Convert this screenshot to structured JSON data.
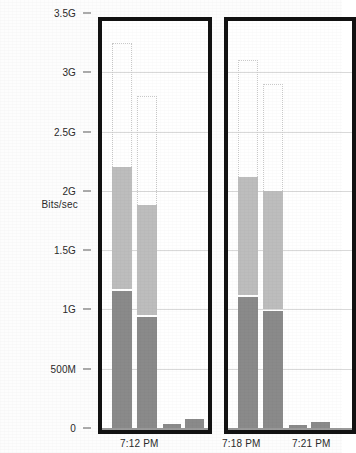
{
  "chart_data": {
    "type": "bar",
    "title": "",
    "subtitle": "",
    "xlabel": "",
    "ylabel": "Bits/sec",
    "stacked": true,
    "grid": true,
    "legend": null,
    "ylim": [
      0,
      3.5
    ],
    "y_unit": "bits/sec",
    "y_ticks": [
      {
        "label": "3.5G",
        "value": 3.5
      },
      {
        "label": "3G",
        "value": 3.0
      },
      {
        "label": "2.5G",
        "value": 2.5
      },
      {
        "label": "2G",
        "value": 2.0
      },
      {
        "label": "1.5G",
        "value": 1.5
      },
      {
        "label": "1G",
        "value": 1.0
      },
      {
        "label": "500M",
        "value": 0.5
      },
      {
        "label": "0",
        "value": 0.0
      }
    ],
    "x_tick_labels": [
      "7:12 PM",
      "7:18 PM",
      "7:21 PM"
    ],
    "series": [
      {
        "name": "lower-segment",
        "color": "#8a8a8a",
        "values": [
          1.17,
          0.95,
          0.05,
          0.09,
          1.12,
          1.0,
          0.04,
          0.07
        ]
      },
      {
        "name": "upper-segment",
        "color": "#bdbdbd",
        "values": [
          1.03,
          0.93,
          0.0,
          0.0,
          1.0,
          1.0,
          0.0,
          0.0
        ]
      }
    ],
    "totals": [
      2.2,
      1.88,
      0.05,
      0.09,
      2.12,
      2.0,
      0.04,
      0.07
    ],
    "panels": [
      {
        "id": "panel-left",
        "x_label": "7:12 PM",
        "bars": [
          {
            "index": 0,
            "total": 2.2,
            "lower": 1.17,
            "upper": 1.03,
            "ghost_top": 3.25
          },
          {
            "index": 1,
            "total": 1.88,
            "lower": 0.95,
            "upper": 0.93,
            "ghost_top": 2.8
          },
          {
            "index": 2,
            "total": 0.05,
            "lower": 0.05,
            "upper": 0.0,
            "ghost_top": 0.0
          },
          {
            "index": 3,
            "total": 0.09,
            "lower": 0.09,
            "upper": 0.0,
            "ghost_top": 0.0
          }
        ]
      },
      {
        "id": "panel-right",
        "x_label": "7:18 PM",
        "x_label_2": "7:21 PM",
        "bars": [
          {
            "index": 0,
            "total": 2.12,
            "lower": 1.12,
            "upper": 1.0,
            "ghost_top": 3.1
          },
          {
            "index": 1,
            "total": 2.0,
            "lower": 1.0,
            "upper": 1.0,
            "ghost_top": 2.9
          },
          {
            "index": 2,
            "total": 0.04,
            "lower": 0.04,
            "upper": 0.0,
            "ghost_top": 0.0
          },
          {
            "index": 3,
            "total": 0.07,
            "lower": 0.07,
            "upper": 0.0,
            "ghost_top": 0.0
          }
        ]
      }
    ],
    "colors": {
      "lower_segment": "#8a8a8a",
      "upper_segment": "#bdbdbd",
      "panel_border": "#121212",
      "gridline": "#d9d9d9",
      "text": "#2b2b2b",
      "background": "#ffffff"
    }
  },
  "axis": {
    "y_title": "Bits/sec"
  }
}
